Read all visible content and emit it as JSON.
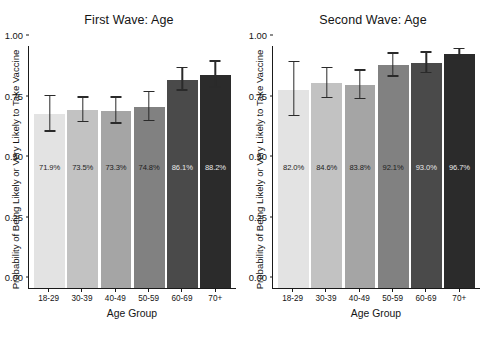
{
  "chart_data": [
    {
      "type": "bar",
      "title": "First Wave: Age",
      "xlabel": "Age Group",
      "ylabel": "Probability of Being Likely or Very Likely to Take Vaccine",
      "ylim": [
        0.0,
        1.0
      ],
      "yticks": [
        "0.00",
        "0.25",
        "0.50",
        "0.75",
        "1.00"
      ],
      "ytick_values": [
        0.0,
        0.25,
        0.5,
        0.75,
        1.0
      ],
      "grid": false,
      "legend": "none",
      "categories": [
        "18-29",
        "30-39",
        "40-49",
        "50-59",
        "60-69",
        "70+"
      ],
      "values": [
        0.719,
        0.735,
        0.733,
        0.748,
        0.861,
        0.882
      ],
      "data_labels": [
        "71.9%",
        "73.5%",
        "73.3%",
        "74.8%",
        "86.1%",
        "88.2%"
      ],
      "error_low": [
        0.646,
        0.685,
        0.679,
        0.69,
        0.815,
        0.827
      ],
      "error_high": [
        0.793,
        0.787,
        0.787,
        0.808,
        0.908,
        0.936
      ],
      "bar_colors": [
        "#e3e3e3",
        "#c2c2c2",
        "#a5a5a5",
        "#818181",
        "#4a4a4a",
        "#2b2b2b"
      ],
      "label_on_dark": [
        false,
        false,
        false,
        false,
        true,
        true
      ]
    },
    {
      "type": "bar",
      "title": "Second Wave: Age",
      "xlabel": "Age Group",
      "ylabel": "Probability of Being Likely or Very Likely to Take Vaccine",
      "ylim": [
        0.0,
        1.0
      ],
      "yticks": [
        "0.00",
        "0.25",
        "0.50",
        "0.75",
        "1.00"
      ],
      "ytick_values": [
        0.0,
        0.25,
        0.5,
        0.75,
        1.0
      ],
      "grid": false,
      "legend": "none",
      "categories": [
        "18-29",
        "30-39",
        "40-49",
        "50-59",
        "60-69",
        "70+"
      ],
      "values": [
        0.82,
        0.846,
        0.838,
        0.921,
        0.93,
        0.967
      ],
      "data_labels": [
        "82.0%",
        "84.6%",
        "83.8%",
        "92.1%",
        "93.0%",
        "96.7%"
      ],
      "error_low": [
        0.71,
        0.785,
        0.78,
        0.873,
        0.888,
        0.948
      ],
      "error_high": [
        0.932,
        0.908,
        0.898,
        0.968,
        0.972,
        0.987
      ],
      "bar_colors": [
        "#e3e3e3",
        "#c2c2c2",
        "#a5a5a5",
        "#818181",
        "#4a4a4a",
        "#2b2b2b"
      ],
      "label_on_dark": [
        false,
        false,
        false,
        false,
        true,
        true
      ]
    }
  ]
}
